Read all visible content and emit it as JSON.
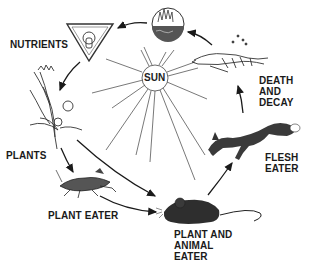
{
  "diagram": {
    "center": {
      "label": "SUN",
      "icon": "sun-icon"
    },
    "stages": [
      {
        "id": "nutrients",
        "label": "NUTRIENTS",
        "icon": "nutrient-triangle-icon"
      },
      {
        "id": "plants",
        "label": "PLANTS",
        "icon": "wheat-plant-icon"
      },
      {
        "id": "plant-eater",
        "label": "PLANT EATER",
        "icon": "grasshopper-icon"
      },
      {
        "id": "plant-and-animal-eater",
        "label": "PLANT AND\nANIMAL\nEATER",
        "icon": "mouse-icon"
      },
      {
        "id": "flesh-eater",
        "label": "FLESH\nEATER",
        "icon": "fox-icon"
      },
      {
        "id": "death-and-decay",
        "label": "DEATH\nAND\nDECAY",
        "icon": "skeleton-icon"
      },
      {
        "id": "soil",
        "label": "",
        "icon": "soil-decomposition-circle-icon"
      }
    ],
    "flow": [
      [
        "soil",
        "nutrients"
      ],
      [
        "nutrients",
        "plants"
      ],
      [
        "plants",
        "plant-eater"
      ],
      [
        "plants",
        "plant-and-animal-eater"
      ],
      [
        "plant-eater",
        "plant-and-animal-eater"
      ],
      [
        "plant-and-animal-eater",
        "flesh-eater"
      ],
      [
        "flesh-eater",
        "death-and-decay"
      ],
      [
        "death-and-decay",
        "soil"
      ]
    ],
    "colors": {
      "ink": "#1a1a1a",
      "ray": "#555555",
      "fill_dark": "#3a3a3a",
      "background": "#ffffff"
    }
  }
}
